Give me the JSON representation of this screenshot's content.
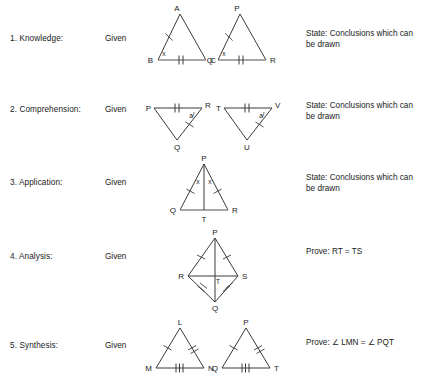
{
  "worksheet": {
    "rows": [
      {
        "id": "knowledge",
        "label": "1. Knowledge:",
        "given": "Given",
        "task": "State: Conclusions which can\n          be drawn",
        "figures": [
          {
            "name": "triangle-abc",
            "vertices": {
              "apex": "A",
              "left": "B",
              "right": "C"
            },
            "angle_marks": [
              {
                "at": "B",
                "text": "x"
              }
            ],
            "tick_marks": [
              {
                "side": "AB",
                "count": 1
              },
              {
                "side": "BC",
                "count": 2
              }
            ]
          },
          {
            "name": "triangle-pqr",
            "vertices": {
              "apex": "P",
              "left": "Q",
              "right": "R"
            },
            "angle_marks": [
              {
                "at": "Q",
                "text": "x"
              }
            ],
            "tick_marks": [
              {
                "side": "PQ",
                "count": 1
              },
              {
                "side": "QR",
                "count": 2
              }
            ]
          }
        ]
      },
      {
        "id": "comprehension",
        "label": "2. Comprehension:",
        "given": "Given",
        "task": "State: Conclusions which can\n          be drawn",
        "figures": [
          {
            "name": "triangle-pqr-inverted",
            "vertices": {
              "topleft": "P",
              "topright": "R",
              "bottom": "Q"
            },
            "angle_marks": [
              {
                "at": "R",
                "text": "a"
              }
            ],
            "tick_marks": [
              {
                "side": "PR",
                "count": 2
              },
              {
                "side": "QR",
                "count": 1
              }
            ]
          },
          {
            "name": "triangle-tuv-inverted",
            "vertices": {
              "topleft": "T",
              "topright": "V",
              "bottom": "U"
            },
            "angle_marks": [
              {
                "at": "V",
                "text": "a"
              }
            ],
            "tick_marks": [
              {
                "side": "TV",
                "count": 2
              },
              {
                "side": "UV",
                "count": 1
              }
            ]
          }
        ]
      },
      {
        "id": "application",
        "label": "3. Application:",
        "given": "Given",
        "task": "State: Conclusions which can\n          be drawn",
        "figures": [
          {
            "name": "triangle-pqr-altitude",
            "vertices": {
              "apex": "P",
              "left": "Q",
              "right": "R",
              "foot": "T"
            },
            "angle_marks": [
              {
                "at": "P-left",
                "text": "x"
              },
              {
                "at": "P-right",
                "text": "x"
              }
            ],
            "tick_marks": [
              {
                "side": "PQ",
                "count": 1
              },
              {
                "side": "PR",
                "count": 1
              }
            ],
            "cevian": "PT"
          }
        ]
      },
      {
        "id": "analysis",
        "label": "4. Analysis:",
        "given": "Given",
        "task": "Prove: RT = TS",
        "figures": [
          {
            "name": "kite-prqs",
            "vertices": {
              "top": "P",
              "left": "R",
              "right": "S",
              "bottom": "Q",
              "center": "T"
            },
            "tick_marks": [
              {
                "side": "PR",
                "count": 1
              },
              {
                "side": "PS",
                "count": 1
              },
              {
                "side": "RQ",
                "count": 2
              },
              {
                "side": "QS",
                "count": 2
              }
            ],
            "diagonals": [
              "PQ",
              "RS"
            ]
          }
        ]
      },
      {
        "id": "synthesis",
        "label": "5. Synthesis:",
        "given": "Given",
        "task": "Prove:  ∠ LMN = ∠ PQT",
        "figures": [
          {
            "name": "triangle-lmn",
            "vertices": {
              "apex": "L",
              "left": "M",
              "right": "N"
            },
            "tick_marks": [
              {
                "side": "LM",
                "count": 1
              },
              {
                "side": "LN",
                "count": 2
              },
              {
                "side": "MN",
                "count": 3
              }
            ]
          },
          {
            "name": "triangle-pqt",
            "vertices": {
              "apex": "P",
              "left": "Q",
              "right": "T"
            },
            "tick_marks": [
              {
                "side": "PQ",
                "count": 1
              },
              {
                "side": "PT",
                "count": 2
              },
              {
                "side": "QT",
                "count": 3
              }
            ]
          }
        ]
      }
    ]
  },
  "style": {
    "stroke": "#3a3a3a",
    "base_stroke": "#8a8a8a",
    "text": "#1a1a1a",
    "background": "#ffffff"
  }
}
